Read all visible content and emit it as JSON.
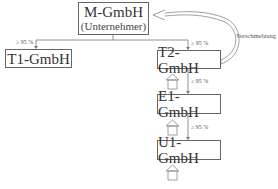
{
  "diagram": {
    "nodes": [
      {
        "id": "M",
        "name": "M-GmbH",
        "subtitle": "(Unternehmer)"
      },
      {
        "id": "T1",
        "name": "T1-GmbH"
      },
      {
        "id": "T2",
        "name": "T2-GmbH"
      },
      {
        "id": "E1",
        "name": "E1-GmbH"
      },
      {
        "id": "U1",
        "name": "U1-GmbH"
      }
    ],
    "edges": [
      {
        "from": "M",
        "to": "T1",
        "label": "≥ 95 %"
      },
      {
        "from": "M",
        "to": "T2",
        "label": "≥ 95 %"
      },
      {
        "from": "T2",
        "to": "E1",
        "label": "≥ 95 %"
      },
      {
        "from": "E1",
        "to": "U1",
        "label": "≥ 95 %"
      },
      {
        "from": "T2",
        "to": "M",
        "label": "Verschmelzung",
        "style": "curved-hollow-arrow"
      }
    ],
    "property_icons": [
      "house-icon under T2",
      "house-icon under E1",
      "house-icon under U1"
    ]
  }
}
